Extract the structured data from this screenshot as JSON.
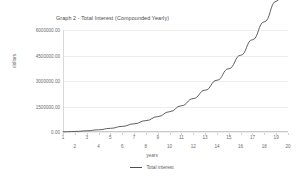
{
  "chart_data": {
    "type": "line",
    "title": "Graph 2 - Total Interest (Compounded Yearly)",
    "xlabel": "years",
    "ylabel": "dollars",
    "grid": true,
    "legend_position": "bottom-center",
    "xlim": [
      1,
      20
    ],
    "ylim": [
      0,
      6000000
    ],
    "ytick_labels": [
      "6000000.00",
      "4500000.00",
      "3000000.00",
      "1500000.00",
      "0.00"
    ],
    "ytick_values": [
      6000000,
      4500000,
      3000000,
      1500000,
      0
    ],
    "xtick_labels": [
      "1",
      "2",
      "3",
      "4",
      "5",
      "6",
      "7",
      "8",
      "9",
      "10",
      "11",
      "12",
      "13",
      "14",
      "15",
      "16",
      "17",
      "18",
      "19",
      "20"
    ],
    "x": [
      1,
      2,
      3,
      4,
      5,
      6,
      7,
      8,
      9,
      10,
      11,
      12,
      13,
      14,
      15,
      16,
      17,
      18,
      19,
      20
    ],
    "series": [
      {
        "name": "Total interest",
        "color": "#4d4d4d",
        "values": [
          20000,
          62000,
          130000,
          232000,
          376000,
          573000,
          835000,
          1176000,
          1613000,
          2165000,
          2856000,
          3712000,
          4764000,
          6049000,
          7609000,
          9493000,
          11759000,
          14472000,
          17710000,
          21560000
        ],
        "values_displayed": [
          10000,
          30000,
          70000,
          130000,
          215000,
          330000,
          480000,
          670000,
          905000,
          1195000,
          1545000,
          1965000,
          2460000,
          3045000,
          3725000,
          4515000,
          5430000,
          6480000,
          7690000,
          9075000
        ]
      }
    ],
    "legend": [
      {
        "label": "Total interest",
        "color": "#4d4d4d",
        "marker": "line"
      }
    ]
  },
  "colors": {
    "line": "#4d4d4d",
    "grid": "#ededed",
    "axis": "#c9c9c9",
    "text": "#6b6b6b",
    "title_text": "#4a4a4a",
    "background": "#ffffff"
  }
}
